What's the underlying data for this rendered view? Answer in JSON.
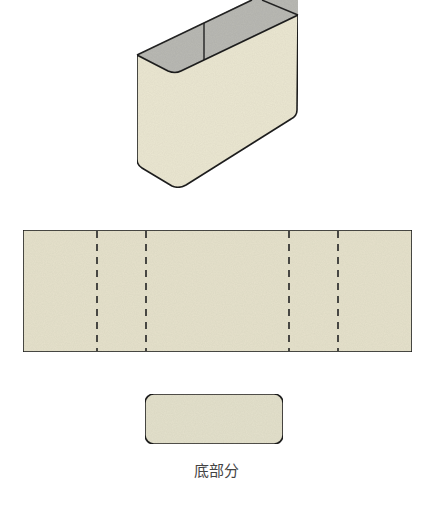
{
  "figure": {
    "colors": {
      "paper_fill": "#ebe7d2",
      "interior_fill": "#b9b9b4",
      "outline": "#222222",
      "label_text": "#444444"
    },
    "box_3d": {
      "name": "open rectangular box (3D view)"
    },
    "side_strip": {
      "name": "unfolded side wall strip",
      "fold_lines": 4,
      "fold_line_style": "dashed"
    },
    "bottom_piece": {
      "name": "bottom part",
      "label": "底部分"
    }
  }
}
